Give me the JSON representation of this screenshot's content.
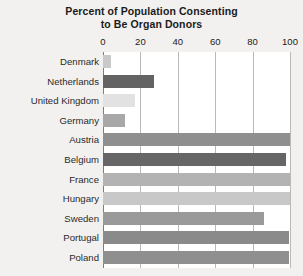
{
  "chart_data": {
    "type": "bar",
    "orientation": "horizontal",
    "title": "Percent of Population Consenting to Be Organ Donors",
    "title_lines": [
      "Percent of Population Consenting",
      "to Be Organ Donors"
    ],
    "xlabel": "",
    "ylabel": "",
    "xlim": [
      0,
      100
    ],
    "xticks": [
      0,
      20,
      40,
      60,
      80,
      100
    ],
    "xtick_labels": [
      "0",
      "20",
      "40",
      "60",
      "80",
      "100"
    ],
    "grid": true,
    "grid_axis": "x",
    "legend": false,
    "categories": [
      "Denmark",
      "Netherlands",
      "United Kingdom",
      "Germany",
      "Austria",
      "Belgium",
      "France",
      "Hungary",
      "Sweden",
      "Portugal",
      "Poland"
    ],
    "values": [
      4.25,
      27.5,
      17.17,
      12,
      99.98,
      98,
      99.91,
      99.97,
      85.9,
      99.64,
      99.5
    ],
    "bar_colors": [
      "#c9c9c9",
      "#636363",
      "#e2e2e2",
      "#a8a8a8",
      "#8f8f8f",
      "#666666",
      "#b3b3b3",
      "#c8c8c8",
      "#9a9a9a",
      "#8a8a8a",
      "#8f8f8f"
    ]
  },
  "style": {
    "page_background": "#f2f1ef",
    "plot_background": "#ffffff",
    "gridline_color": "#b9b9b9",
    "axis_color": "#7d7d7d",
    "label_color": "#2a2a2a",
    "title_color": "#1b1b1b"
  }
}
